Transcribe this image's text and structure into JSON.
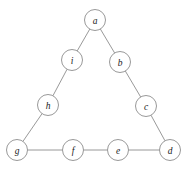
{
  "diagram": {
    "type": "undirected-graph",
    "title": "",
    "background_color": "#ffffff",
    "node_fill_color": "#ffffff",
    "node_stroke_color": "#8d8d8d",
    "edge_color": "#8d8d8d",
    "label_color": "#1a1a1a",
    "node_radius": 10.5,
    "nodes": [
      {
        "id": "a",
        "label": "a",
        "x": 95,
        "y": 20
      },
      {
        "id": "b",
        "label": "b",
        "x": 120,
        "y": 62
      },
      {
        "id": "c",
        "label": "c",
        "x": 146,
        "y": 106
      },
      {
        "id": "d",
        "label": "d",
        "x": 170,
        "y": 150
      },
      {
        "id": "e",
        "label": "e",
        "x": 118,
        "y": 150
      },
      {
        "id": "f",
        "label": "f",
        "x": 73,
        "y": 150
      },
      {
        "id": "g",
        "label": "g",
        "x": 17,
        "y": 150
      },
      {
        "id": "h",
        "label": "h",
        "x": 48,
        "y": 105
      },
      {
        "id": "i",
        "label": "i",
        "x": 72,
        "y": 60
      }
    ],
    "edges": [
      {
        "from": "a",
        "to": "b"
      },
      {
        "from": "b",
        "to": "c"
      },
      {
        "from": "c",
        "to": "d"
      },
      {
        "from": "d",
        "to": "e"
      },
      {
        "from": "e",
        "to": "f"
      },
      {
        "from": "f",
        "to": "g"
      },
      {
        "from": "g",
        "to": "h"
      },
      {
        "from": "h",
        "to": "i"
      },
      {
        "from": "i",
        "to": "a"
      }
    ]
  }
}
